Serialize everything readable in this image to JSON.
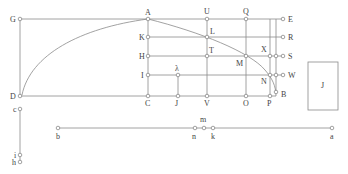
{
  "diagram": {
    "labels": {
      "G": "G",
      "A": "A",
      "U": "U",
      "Q": "Q",
      "E": "E",
      "K": "K",
      "L": "L",
      "R": "R",
      "H": "H",
      "T": "T",
      "M": "M",
      "X": "X",
      "S": "S",
      "I": "I",
      "lambda": "λ",
      "N": "N",
      "W": "W",
      "D": "D",
      "C": "C",
      "J": "J",
      "V": "V",
      "O": "O",
      "P": "P",
      "B": "B",
      "box": "J",
      "c": "c",
      "i": "i",
      "h": "h",
      "b": "b",
      "n": "n",
      "m": "m",
      "k": "k",
      "a": "a"
    },
    "colors": {
      "line": "#8a8a8a",
      "text": "#444444",
      "background": "#ffffff"
    }
  }
}
